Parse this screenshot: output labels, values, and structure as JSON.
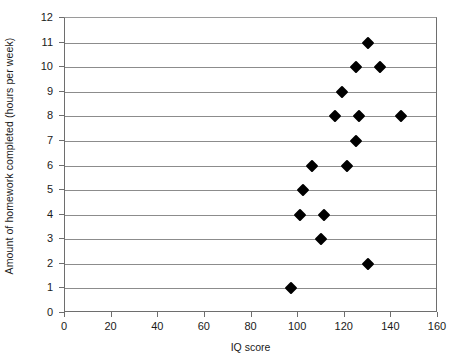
{
  "chart_data": {
    "type": "scatter",
    "title": "",
    "xlabel": "IQ score",
    "ylabel": "Amount of homework completed (hours per week)",
    "xlim": [
      0,
      160
    ],
    "ylim": [
      0,
      12
    ],
    "x_ticks": [
      0,
      20,
      40,
      60,
      80,
      100,
      120,
      140,
      160
    ],
    "y_ticks": [
      0,
      1,
      2,
      3,
      4,
      5,
      6,
      7,
      8,
      9,
      10,
      11,
      12
    ],
    "grid": "horizontal",
    "legend": null,
    "marker": "diamond",
    "marker_color": "#000000",
    "points": [
      {
        "x": 130,
        "y": 11
      },
      {
        "x": 125,
        "y": 10
      },
      {
        "x": 135,
        "y": 10
      },
      {
        "x": 119,
        "y": 9
      },
      {
        "x": 116,
        "y": 8
      },
      {
        "x": 126,
        "y": 8
      },
      {
        "x": 144,
        "y": 8
      },
      {
        "x": 125,
        "y": 7
      },
      {
        "x": 106,
        "y": 6
      },
      {
        "x": 121,
        "y": 6
      },
      {
        "x": 102,
        "y": 5
      },
      {
        "x": 101,
        "y": 4
      },
      {
        "x": 111,
        "y": 4
      },
      {
        "x": 110,
        "y": 3
      },
      {
        "x": 130,
        "y": 2
      },
      {
        "x": 97,
        "y": 1
      }
    ]
  },
  "axes": {
    "x_title": "IQ score",
    "y_title": "Amount of homework completed (hours per week)",
    "x_tick_labels": [
      "0",
      "20",
      "40",
      "60",
      "80",
      "100",
      "120",
      "140",
      "160"
    ],
    "y_tick_labels": [
      "0",
      "1",
      "2",
      "3",
      "4",
      "5",
      "6",
      "7",
      "8",
      "9",
      "10",
      "11",
      "12"
    ]
  },
  "colors": {
    "marker": "#000000",
    "gridline": "#8c8c8c",
    "axis": "#6e6e6e",
    "text": "#1a1a1a",
    "background": "#ffffff"
  }
}
